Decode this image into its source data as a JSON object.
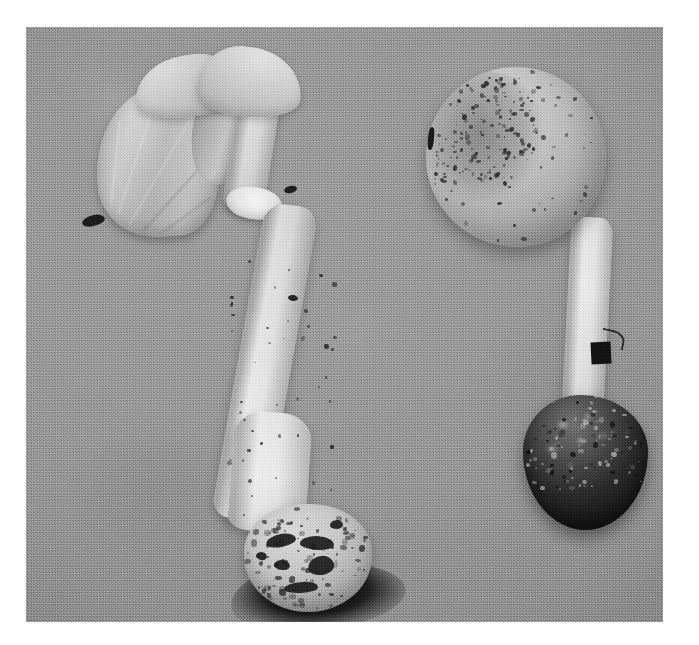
{
  "media": {
    "kind": "photograph",
    "rendering": "black-and-white",
    "caption_visible": "",
    "border_color": "#ffffff",
    "background_color": "#8b8b8b",
    "photo_rect": {
      "x": 26,
      "y": 27,
      "width": 637,
      "height": 595
    }
  },
  "scene": {
    "subject": "two mushroom specimens laid on a plain cloth background",
    "subject_count": 2,
    "surface": "flat gray fabric / paper backdrop",
    "lighting": "soft even light from upper left",
    "shadow_color": "#111111"
  },
  "specimens": [
    {
      "id": "left-specimen",
      "position": "left of frame, oriented cap-up-left, base lower-right",
      "cap": {
        "state": "split and folded back, hanging as a torn veil-like flap",
        "color": "#c2bfb8",
        "parts": [
          "left fan lobe",
          "upper torn flap",
          "second torn flap",
          "folded middle flap"
        ]
      },
      "annulus": {
        "present": "yes",
        "description": "pale skirt-like ring on upper stem",
        "color": "#efede8"
      },
      "stipe": {
        "shape": "long, slightly curved, widening toward the base",
        "color": "#dcd9d2",
        "surface": "smooth with scattered dark specks of soil"
      },
      "base": {
        "type": "bulbous volva",
        "color": "#c4c0b7",
        "surface": "granular, patched with dark soil and pitted dark holes"
      },
      "cast_shadow": "dark shadow pooled beneath and to the left of the bulb"
    },
    {
      "id": "right-specimen",
      "position": "right of frame, cap at top, base at bottom",
      "cap": {
        "state": "intact, rounded / globose, unexpanded",
        "color": "#beb9b0",
        "surface": "heavily flecked with dark soil particles, densest on the upper left"
      },
      "annulus": {
        "present": "not visible",
        "description": "",
        "color": ""
      },
      "stipe": {
        "shape": "straight, fairly even width, slightly tapering upward",
        "color": "#dcd9d2",
        "surface": "pale with fine dark specks and longitudinal fibres"
      },
      "base": {
        "type": "bulbous volva",
        "color": "#262320",
        "surface": "caked with very dark soil, nearly black"
      },
      "cast_shadow": "soft shadow hugging the right and lower edge of the bulb"
    }
  ],
  "artifacts": [
    {
      "id": "debris-left",
      "description": "small dark fleck of debris on the cloth at the left edge"
    },
    {
      "id": "marker-right",
      "description": "small black rectangular mark with a thin hook beside the right stem"
    },
    {
      "id": "debris-cap-edge",
      "description": "short dark nick on the left margin of the right cap"
    }
  ],
  "palette": {
    "cloth": "#8b8b8b",
    "flesh_light": "#e2dfd8",
    "flesh_mid": "#c2bfb8",
    "flesh_shadow": "#918e88",
    "soil_dark": "#1b1b1b",
    "border": "#ffffff"
  }
}
